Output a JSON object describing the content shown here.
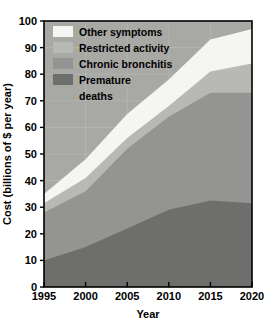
{
  "chart_data": {
    "type": "area",
    "stacked": true,
    "title": "",
    "subtitle": "",
    "xlabel": "Year",
    "ylabel": "Cost (billions of $ per year)",
    "x": [
      1995,
      2000,
      2005,
      2010,
      2015,
      2020
    ],
    "xlim": [
      1995,
      2020
    ],
    "ylim": [
      0,
      100
    ],
    "xticks": [
      1995,
      2000,
      2005,
      2010,
      2015,
      2020
    ],
    "xtick_labels": [
      "1995",
      "2000",
      "2005",
      "2010",
      "2015",
      "2020"
    ],
    "yticks": [
      0,
      10,
      20,
      30,
      40,
      50,
      60,
      70,
      80,
      90,
      100
    ],
    "ytick_labels": [
      "0",
      "10",
      "20",
      "30",
      "40",
      "50",
      "60",
      "70",
      "80",
      "90",
      "100"
    ],
    "grid": true,
    "legend_position": "top-left-inside",
    "plot_background": "#a8a8a5",
    "series": [
      {
        "name": "Premature deaths",
        "color": "#6e6e6c",
        "values": [
          10,
          15,
          22,
          29,
          32.5,
          31.5
        ]
      },
      {
        "name": "Chronic bronchitis",
        "color": "#949492",
        "values": [
          18,
          21,
          30,
          35,
          40.5,
          41.5
        ]
      },
      {
        "name": "Restricted activity",
        "color": "#b8b8b5",
        "values": [
          3.5,
          5,
          4,
          4,
          8,
          11
        ]
      },
      {
        "name": "Other symptoms",
        "color": "#f5f5f2",
        "values": [
          3.5,
          7,
          9,
          10,
          12,
          13
        ]
      }
    ],
    "cumulative_tops": {
      "Premature deaths": [
        10,
        15,
        22,
        29,
        32.5,
        31.5
      ],
      "Chronic bronchitis": [
        28,
        36,
        52,
        64,
        73,
        73
      ],
      "Restricted activity": [
        31.5,
        41,
        56,
        68,
        81,
        84
      ],
      "Other symptoms": [
        35,
        48,
        65,
        78,
        93,
        97
      ]
    }
  },
  "legend": {
    "items": [
      {
        "label": "Other symptoms",
        "color": "#f5f5f2"
      },
      {
        "label": "Restricted activity",
        "color": "#b8b8b5"
      },
      {
        "label": "Chronic bronchitis",
        "color": "#949492"
      },
      {
        "label": "Premature",
        "color": "#6e6e6c"
      },
      {
        "label": "deaths",
        "color": ""
      }
    ]
  },
  "axes": {
    "y_title": "Cost (billions of $ per year)",
    "x_title": "Year",
    "y_labels": [
      "100",
      "90",
      "80",
      "70",
      "60",
      "50",
      "40",
      "30",
      "20",
      "10",
      "0"
    ],
    "x_labels": [
      "1995",
      "2000",
      "2005",
      "2010",
      "2015",
      "2020"
    ]
  },
  "colors": {
    "other_symptoms": "#f5f5f2",
    "restricted_activity": "#b8b8b5",
    "chronic_bronchitis": "#949492",
    "premature_deaths": "#6e6e6c",
    "plot_bg": "#a8a8a5",
    "axis": "#000000",
    "grid": "#c4c4c0",
    "page_bg": "#ffffff"
  }
}
